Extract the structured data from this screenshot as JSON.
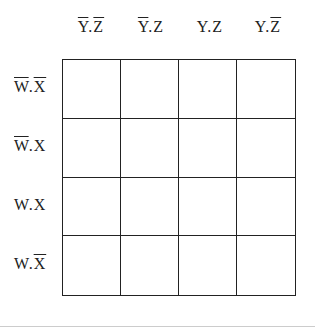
{
  "kmap": {
    "column_labels": [
      {
        "parts": [
          {
            "text": "Y",
            "bar": true
          },
          {
            "text": ".",
            "bar": false
          },
          {
            "text": "Z",
            "bar": true
          }
        ],
        "plain": "Y'.Z'"
      },
      {
        "parts": [
          {
            "text": "Y",
            "bar": true
          },
          {
            "text": ".",
            "bar": false
          },
          {
            "text": "Z",
            "bar": false
          }
        ],
        "plain": "Y'.Z"
      },
      {
        "parts": [
          {
            "text": "Y",
            "bar": false
          },
          {
            "text": ".",
            "bar": false
          },
          {
            "text": "Z",
            "bar": false
          }
        ],
        "plain": "Y.Z"
      },
      {
        "parts": [
          {
            "text": "Y",
            "bar": false
          },
          {
            "text": ".",
            "bar": false
          },
          {
            "text": "Z",
            "bar": true
          }
        ],
        "plain": "Y.Z'"
      }
    ],
    "row_labels": [
      {
        "parts": [
          {
            "text": "W",
            "bar": true
          },
          {
            "text": ".",
            "bar": false
          },
          {
            "text": "X",
            "bar": true
          }
        ],
        "plain": "W'.X'"
      },
      {
        "parts": [
          {
            "text": "W",
            "bar": true
          },
          {
            "text": ".",
            "bar": false
          },
          {
            "text": "X",
            "bar": false
          }
        ],
        "plain": "W'.X"
      },
      {
        "parts": [
          {
            "text": "W",
            "bar": false
          },
          {
            "text": ".",
            "bar": false
          },
          {
            "text": "X",
            "bar": false
          }
        ],
        "plain": "W.X"
      },
      {
        "parts": [
          {
            "text": "W",
            "bar": false
          },
          {
            "text": ".",
            "bar": false
          },
          {
            "text": "X",
            "bar": true
          }
        ],
        "plain": "W.X'"
      }
    ],
    "cells": [
      [
        "",
        "",
        "",
        ""
      ],
      [
        "",
        "",
        "",
        ""
      ],
      [
        "",
        "",
        "",
        ""
      ],
      [
        "",
        "",
        "",
        ""
      ]
    ]
  }
}
